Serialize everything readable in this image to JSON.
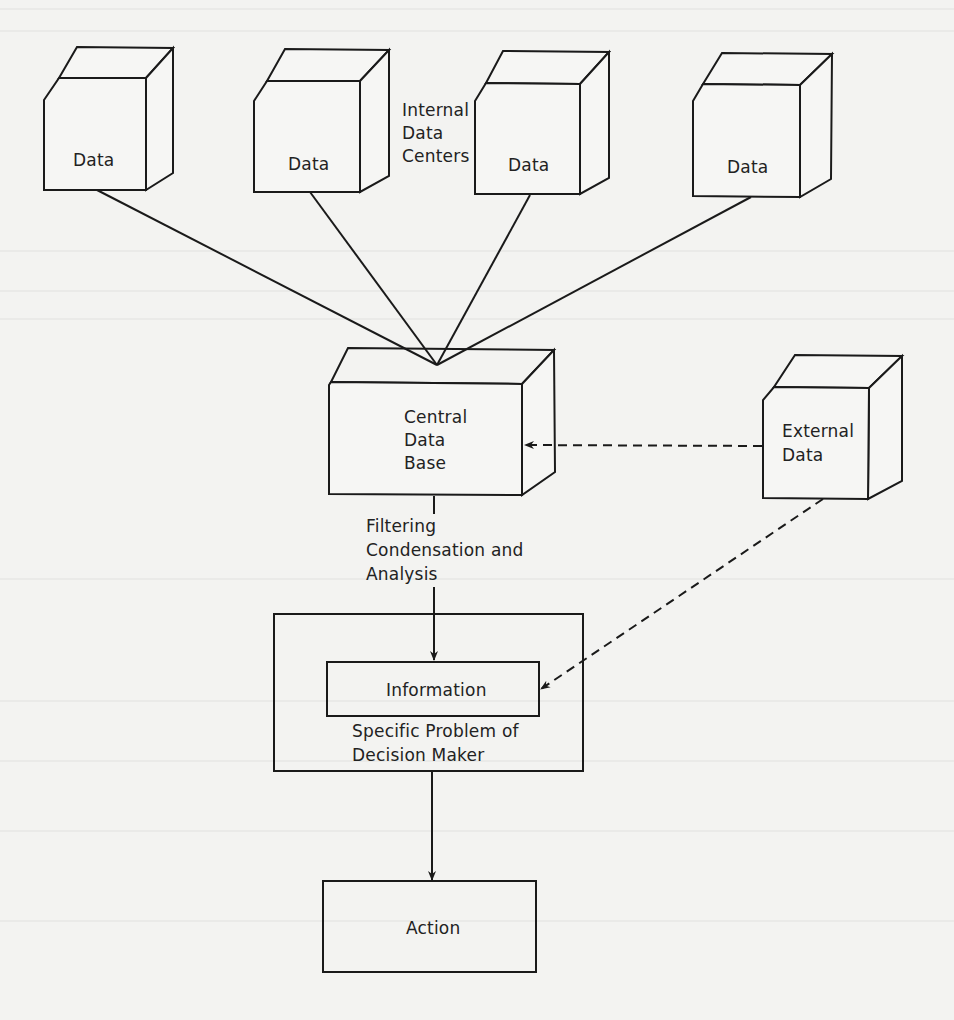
{
  "diagram": {
    "internal_label": [
      "Internal",
      "Data",
      "Centers"
    ],
    "data_centers": [
      {
        "label": "Data"
      },
      {
        "label": "Data"
      },
      {
        "label": "Data"
      },
      {
        "label": "Data"
      }
    ],
    "central": {
      "lines": [
        "Central",
        "Data",
        "Base"
      ]
    },
    "external": {
      "lines": [
        "External",
        "Data"
      ]
    },
    "process_label": [
      "Filtering",
      "Condensation and",
      "Analysis"
    ],
    "information": {
      "label": "Information"
    },
    "decision_box": {
      "lines": [
        "Specific Problem of",
        "Decision Maker"
      ]
    },
    "action": {
      "label": "Action"
    },
    "colors": {
      "ink": "#1a1a1a",
      "paper": "#f3f3f1"
    }
  }
}
